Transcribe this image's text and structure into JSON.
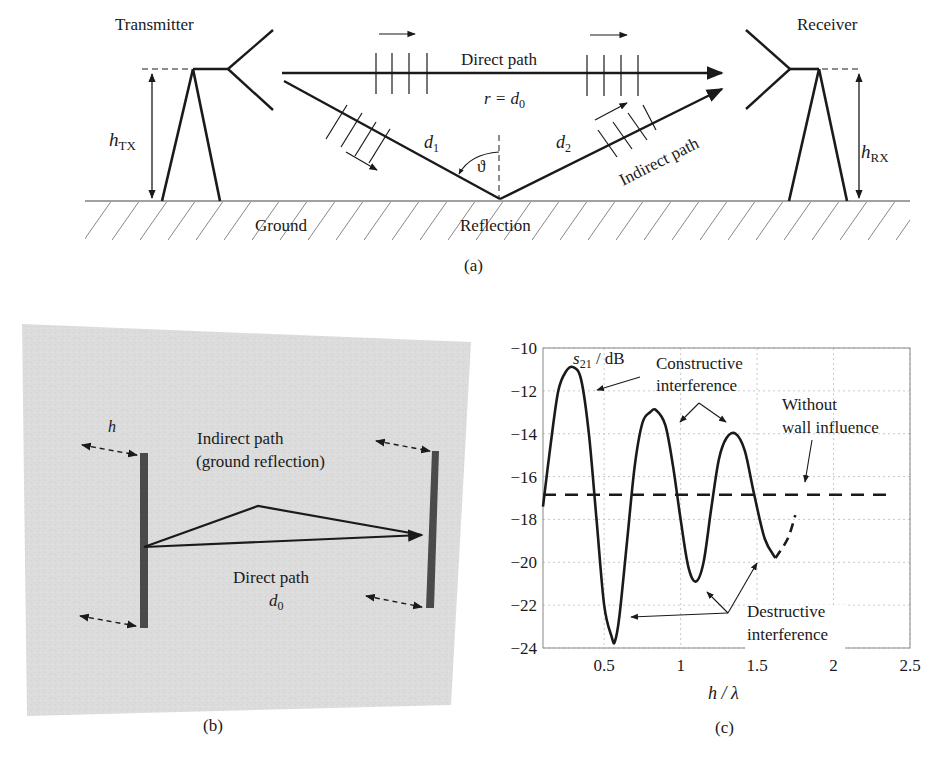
{
  "panel_a": {
    "caption": "(a)",
    "transmitter_label": "Transmitter",
    "receiver_label": "Receiver",
    "direct_path_label": "Direct path",
    "r_label": "r = d",
    "r_sub": "0",
    "d1_label": "d",
    "d1_sub": "1",
    "d2_label": "d",
    "d2_sub": "2",
    "theta_label": "ϑ",
    "indirect_path_label": "Indirect path",
    "ground_label": "Ground",
    "reflection_label": "Reflection",
    "htx_label": "h",
    "htx_sub": "TX",
    "hrx_label": "h",
    "hrx_sub": "RX"
  },
  "panel_b": {
    "caption": "(b)",
    "h_label": "h",
    "indirect_line1": "Indirect path",
    "indirect_line2": "(ground reflection)",
    "direct_line1": "Direct path",
    "direct_d": "d",
    "direct_sub": "0"
  },
  "panel_c": {
    "caption": "(c)",
    "annotation_constructive_1": "Constructive",
    "annotation_constructive_2": "interference",
    "annotation_without_1": "Without",
    "annotation_without_2": "wall influence",
    "annotation_destructive_1": "Destructive",
    "annotation_destructive_2": "interference"
  },
  "chart_data": {
    "type": "line",
    "title": "",
    "xlabel": "h / λ",
    "ylabel": "s21 / dB",
    "ylabel_main": "s",
    "ylabel_sub": "21",
    "ylabel_unit": " / dB",
    "xlim": [
      0.1,
      2.5
    ],
    "ylim": [
      -24,
      -10
    ],
    "xticks": [
      0.5,
      1,
      1.5,
      2,
      2.5
    ],
    "xtick_labels": [
      "0.5",
      "1",
      "1.5",
      "2",
      "2.5"
    ],
    "yticks": [
      -10,
      -12,
      -14,
      -16,
      -18,
      -20,
      -22,
      -24
    ],
    "ytick_labels": [
      "−10",
      "−12",
      "−14",
      "−16",
      "−18",
      "−20",
      "−22",
      "−24"
    ],
    "grid": true,
    "series": [
      {
        "name": "With ground reflection (measured)",
        "style": "solid",
        "x": [
          0.1,
          0.15,
          0.2,
          0.25,
          0.3,
          0.35,
          0.4,
          0.45,
          0.5,
          0.55,
          0.57,
          0.6,
          0.65,
          0.7,
          0.75,
          0.8,
          0.84,
          0.9,
          0.95,
          1.0,
          1.05,
          1.1,
          1.15,
          1.2,
          1.25,
          1.3,
          1.36,
          1.42,
          1.48,
          1.55,
          1.62
        ],
        "y": [
          -17.4,
          -14.5,
          -12.0,
          -11.1,
          -10.9,
          -11.5,
          -14.0,
          -18.0,
          -22.0,
          -23.5,
          -23.7,
          -22.5,
          -19.0,
          -15.5,
          -13.5,
          -13.0,
          -12.9,
          -13.6,
          -15.5,
          -18.0,
          -20.2,
          -20.9,
          -20.0,
          -17.5,
          -15.2,
          -14.2,
          -14.0,
          -14.8,
          -16.8,
          -18.9,
          -19.8
        ]
      },
      {
        "name": "Extrapolation",
        "style": "dashed",
        "x": [
          1.62,
          1.7,
          1.75
        ],
        "y": [
          -19.8,
          -18.9,
          -17.8
        ]
      },
      {
        "name": "Without wall influence",
        "style": "dashed",
        "x": [
          0.1,
          2.4
        ],
        "y": [
          -16.85,
          -16.85
        ]
      }
    ],
    "annotations": [
      {
        "text": "Constructive interference",
        "points_to": [
          [
            0.3,
            -11.0
          ],
          [
            0.84,
            -13.0
          ],
          [
            1.36,
            -14.0
          ]
        ]
      },
      {
        "text": "Without wall influence",
        "points_to": [
          [
            1.8,
            -16.3
          ]
        ]
      },
      {
        "text": "Destructive interference",
        "points_to": [
          [
            0.57,
            -23.7
          ],
          [
            1.1,
            -20.9
          ],
          [
            1.5,
            -20.0
          ]
        ]
      }
    ],
    "legend": "none"
  }
}
